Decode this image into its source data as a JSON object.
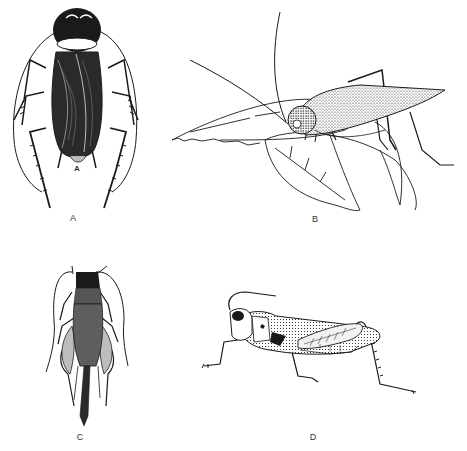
{
  "figure": {
    "panels": [
      {
        "id": "A",
        "label": "A",
        "subject": "cockroach (dorsal view)",
        "label_pos": [
          73,
          213
        ]
      },
      {
        "id": "B",
        "label": "B",
        "subject": "katydid on leaves (lateral view)",
        "label_pos": [
          315,
          214
        ]
      },
      {
        "id": "C",
        "label": "C",
        "subject": "cricket (dorsal view)",
        "label_pos": [
          80,
          432
        ]
      },
      {
        "id": "D",
        "label": "D",
        "subject": "grasshopper (lateral view)",
        "label_pos": [
          313,
          432
        ]
      }
    ],
    "inner_marks": {
      "A_small": "A"
    }
  },
  "colors": {
    "ink": "#1a1a1a",
    "background": "#ffffff",
    "label": "#333333"
  }
}
